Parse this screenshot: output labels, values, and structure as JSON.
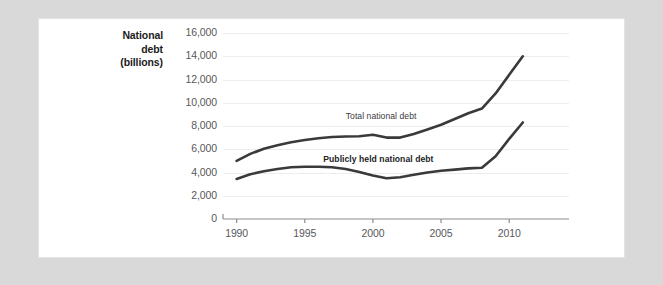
{
  "chart_data": {
    "type": "line",
    "title": "",
    "xlabel": "",
    "ylabel": "National debt (billions)",
    "xlim": [
      1989,
      2011.6
    ],
    "ylim": [
      0,
      16000
    ],
    "grid": true,
    "legend_position": "inline-annotation",
    "x_ticks": [
      "1990",
      "1995",
      "2000",
      "2005",
      "2010"
    ],
    "x_tick_values": [
      1990,
      1995,
      2000,
      2005,
      2010
    ],
    "y_ticks": [
      "0",
      "2,000",
      "4,000",
      "6,000",
      "8,000",
      "10,000",
      "12,000",
      "14,000",
      "16,000"
    ],
    "y_tick_values": [
      0,
      2000,
      4000,
      6000,
      8000,
      10000,
      12000,
      14000,
      16000
    ],
    "x": [
      1990,
      1991,
      1992,
      1993,
      1994,
      1995,
      1996,
      1997,
      1998,
      1999,
      2000,
      2001,
      2002,
      2003,
      2004,
      2005,
      2006,
      2007,
      2008,
      2009,
      2010,
      2011
    ],
    "series": [
      {
        "name": "Total national debt",
        "color": "#3a3a3c",
        "values": [
          5000,
          5600,
          6050,
          6350,
          6600,
          6800,
          6950,
          7050,
          7100,
          7120,
          7250,
          7000,
          7000,
          7300,
          7700,
          8100,
          8600,
          9100,
          9500,
          10800,
          12400,
          14000
        ]
      },
      {
        "name": "Publicly held national debt",
        "color": "#3a3a3c",
        "values": [
          3450,
          3850,
          4100,
          4300,
          4450,
          4500,
          4500,
          4450,
          4300,
          4050,
          3750,
          3500,
          3600,
          3800,
          4000,
          4150,
          4250,
          4350,
          4400,
          5400,
          6900,
          8300
        ]
      }
    ],
    "annotations": [
      {
        "text": "Total national debt",
        "x": 2000.6,
        "y": 8800,
        "bold": false
      },
      {
        "text": "Publicly held national debt",
        "x": 2000.4,
        "y": 5050,
        "bold": true
      }
    ]
  }
}
